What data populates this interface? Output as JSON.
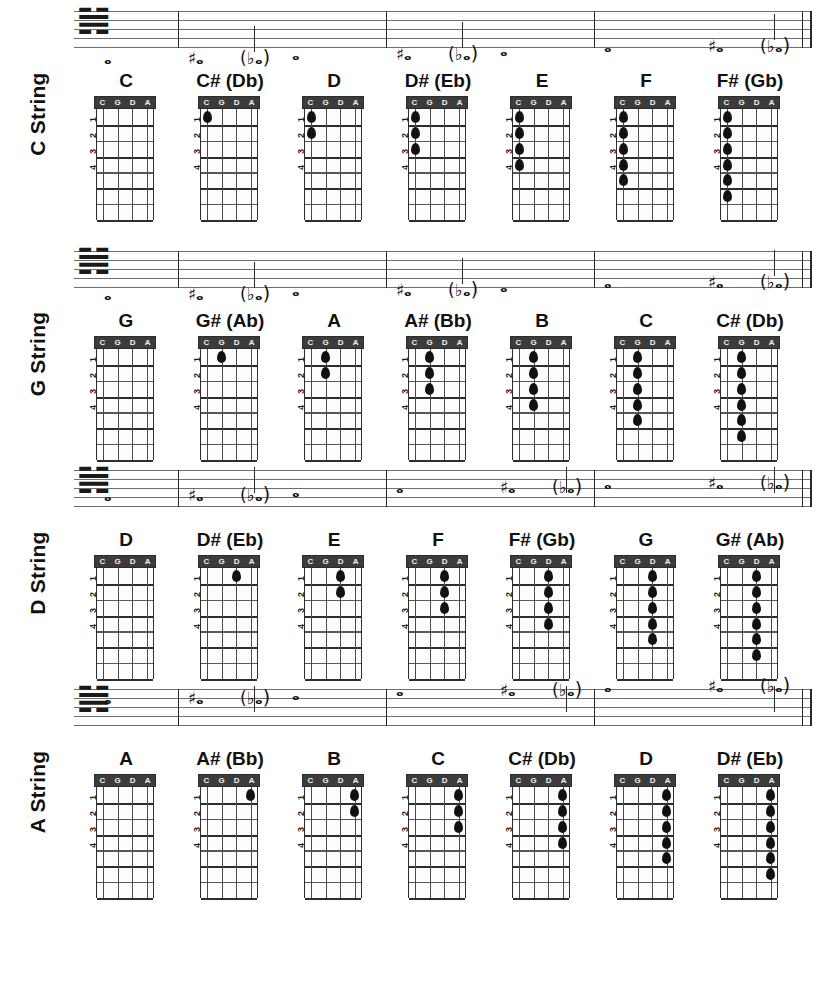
{
  "page": {
    "background_color": "#ffffff",
    "ink_color": "#141414"
  },
  "diagram_legend": {
    "nut_string_labels": [
      "C",
      "G",
      "D",
      "A"
    ],
    "fret_numbers": [
      "1",
      "2",
      "3",
      "4"
    ],
    "clef": "bass-clef",
    "clef_glyph": "𝌢"
  },
  "rows": [
    {
      "id": "c-string",
      "label_accent": "C",
      "label_text": " String",
      "label_full": "C String",
      "string_index": 0,
      "notes": [
        {
          "name": "C",
          "accidental": "",
          "fret": 0,
          "note_glyph": "𝅝",
          "staff_y": 44,
          "ledger": true
        },
        {
          "name": "C# (Db)",
          "accidental": "#",
          "fret": 1,
          "note_glyph": "𝅝",
          "staff_y": 44,
          "ledger": true
        },
        {
          "name": "D",
          "accidental": "",
          "fret": 2,
          "note_glyph": "𝅝",
          "staff_y": 40,
          "ledger": false
        },
        {
          "name": "D# (Eb)",
          "accidental": "#",
          "fret": 3,
          "note_glyph": "𝅝",
          "staff_y": 40,
          "ledger": false
        },
        {
          "name": "E",
          "accidental": "",
          "fret": 4,
          "note_glyph": "𝅝",
          "staff_y": 36,
          "ledger": false
        },
        {
          "name": "F",
          "accidental": "",
          "fret": 5,
          "note_glyph": "𝅝",
          "staff_y": 32,
          "ledger": false
        },
        {
          "name": "F# (Gb)",
          "accidental": "#",
          "fret": 6,
          "note_glyph": "𝅝",
          "staff_y": 32,
          "ledger": false
        }
      ]
    },
    {
      "id": "g-string",
      "label_accent": "G",
      "label_text": " String",
      "label_full": "G String",
      "string_index": 1,
      "notes": [
        {
          "name": "G",
          "accidental": "",
          "fret": 0,
          "note_glyph": "𝅝",
          "staff_y": 40,
          "ledger": false
        },
        {
          "name": "G# (Ab)",
          "accidental": "#",
          "fret": 1,
          "note_glyph": "𝅝",
          "staff_y": 40,
          "ledger": false
        },
        {
          "name": "A",
          "accidental": "",
          "fret": 2,
          "note_glyph": "𝅝",
          "staff_y": 36,
          "ledger": false
        },
        {
          "name": "A# (Bb)",
          "accidental": "#",
          "fret": 3,
          "note_glyph": "𝅝",
          "staff_y": 36,
          "ledger": false
        },
        {
          "name": "B",
          "accidental": "",
          "fret": 4,
          "note_glyph": "𝅝",
          "staff_y": 32,
          "ledger": false
        },
        {
          "name": "C",
          "accidental": "",
          "fret": 5,
          "note_glyph": "𝅝",
          "staff_y": 28,
          "ledger": false
        },
        {
          "name": "C# (Db)",
          "accidental": "#",
          "fret": 6,
          "note_glyph": "𝅝",
          "staff_y": 28,
          "ledger": false
        }
      ]
    },
    {
      "id": "d-string",
      "label_accent": "D",
      "label_text": " String",
      "label_full": "D String",
      "string_index": 2,
      "notes": [
        {
          "name": "D",
          "accidental": "",
          "fret": 0,
          "note_glyph": "𝅝",
          "staff_y": 22,
          "ledger": false
        },
        {
          "name": "D# (Eb)",
          "accidental": "#",
          "fret": 1,
          "note_glyph": "𝅝",
          "staff_y": 22,
          "ledger": false
        },
        {
          "name": "E",
          "accidental": "",
          "fret": 2,
          "note_glyph": "𝅝",
          "staff_y": 18,
          "ledger": false
        },
        {
          "name": "F",
          "accidental": "",
          "fret": 3,
          "note_glyph": "𝅝",
          "staff_y": 14,
          "ledger": false
        },
        {
          "name": "F# (Gb)",
          "accidental": "#",
          "fret": 4,
          "note_glyph": "𝅝",
          "staff_y": 14,
          "ledger": false
        },
        {
          "name": "G",
          "accidental": "",
          "fret": 5,
          "note_glyph": "𝅝",
          "staff_y": 10,
          "ledger": false
        },
        {
          "name": "G# (Ab)",
          "accidental": "#",
          "fret": 6,
          "note_glyph": "𝅝",
          "staff_y": 10,
          "ledger": false
        }
      ]
    },
    {
      "id": "a-string",
      "label_accent": "A",
      "label_text": " String",
      "label_full": "A String",
      "string_index": 3,
      "notes": [
        {
          "name": "A",
          "accidental": "",
          "fret": 0,
          "note_glyph": "𝅝",
          "staff_y": 6,
          "ledger": false
        },
        {
          "name": "A# (Bb)",
          "accidental": "#",
          "fret": 1,
          "note_glyph": "𝅝",
          "staff_y": 6,
          "ledger": false
        },
        {
          "name": "B",
          "accidental": "",
          "fret": 2,
          "note_glyph": "𝅝",
          "staff_y": 2,
          "ledger": false
        },
        {
          "name": "C",
          "accidental": "",
          "fret": 3,
          "note_glyph": "𝅝",
          "staff_y": -2,
          "ledger": true
        },
        {
          "name": "C# (Db)",
          "accidental": "#",
          "fret": 4,
          "note_glyph": "𝅝",
          "staff_y": -2,
          "ledger": true
        },
        {
          "name": "D",
          "accidental": "",
          "fret": 5,
          "note_glyph": "𝅝",
          "staff_y": -6,
          "ledger": true
        },
        {
          "name": "D# (Eb)",
          "accidental": "#",
          "fret": 6,
          "note_glyph": "𝅝",
          "staff_y": -6,
          "ledger": true
        }
      ]
    }
  ]
}
